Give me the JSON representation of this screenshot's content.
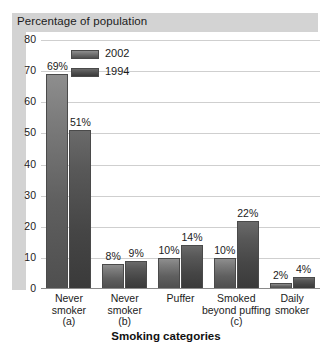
{
  "chart_data": {
    "type": "bar",
    "title": "Percentage of population",
    "xlabel": "Smoking categories",
    "ylabel": "",
    "ylim": [
      0,
      80
    ],
    "yticks": [
      0,
      10,
      20,
      30,
      40,
      50,
      60,
      70,
      80
    ],
    "grid": true,
    "legend_position": "top-left-inside",
    "categories": [
      "Never smoker (a)",
      "Never smoker (b)",
      "Puffer",
      "Smoked beyond puffing (c)",
      "Daily smoker"
    ],
    "category_lines": [
      [
        "Never",
        "smoker",
        "(a)"
      ],
      [
        "Never",
        "smoker",
        "(b)"
      ],
      [
        "Puffer"
      ],
      [
        "Smoked",
        "beyond puffing",
        "(c)"
      ],
      [
        "Daily",
        "smoker"
      ]
    ],
    "series": [
      {
        "name": "2002",
        "color": "#6e6e6e",
        "values": [
          69,
          8,
          10,
          10,
          2
        ],
        "labels": [
          "69%",
          "8%",
          "10%",
          "10%",
          "2%"
        ]
      },
      {
        "name": "1994",
        "color": "#474747",
        "values": [
          51,
          9,
          14,
          22,
          4
        ],
        "labels": [
          "51%",
          "9%",
          "14%",
          "22%",
          "4%"
        ]
      }
    ]
  },
  "chart": {
    "title_band_label": "Percentage of population",
    "xaxis_title": "Smoking categories"
  }
}
